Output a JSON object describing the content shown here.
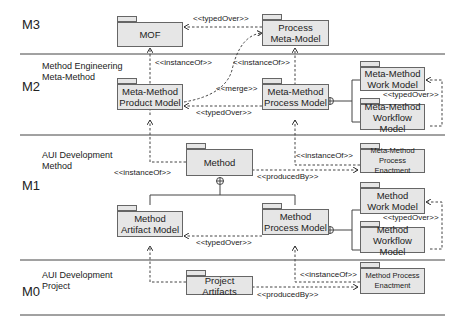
{
  "levels": [
    {
      "id": "M3",
      "label": "M3",
      "description": ""
    },
    {
      "id": "M2",
      "label": "M2",
      "description": "Method Engineering\nMeta-Method"
    },
    {
      "id": "M1",
      "label": "M1",
      "description": "AUI Development\nMethod"
    },
    {
      "id": "M0",
      "label": "M0",
      "description": "AUI Development\nProject"
    }
  ],
  "packages": {
    "mof": "MOF",
    "process_meta_model": "Process\nMeta-Model",
    "mm_product_model": "Meta-Method\nProduct Model",
    "mm_process_model": "Meta-Method\nProcess Model",
    "mm_work_model": "Meta-Method\nWork Model",
    "mm_workflow_model": "Meta-Method\nWorkflow Model",
    "method": "Method",
    "mm_process_enactment": "Meta-Method\nProcess Enactment",
    "method_artifact_model": "Method\nArtifact Model",
    "method_process_model": "Method\nProcess Model",
    "method_work_model": "Method\nWork Model",
    "method_workflow_model": "Method\nWorkflow Model",
    "project_artifacts": "Project Artifacts",
    "method_process_enactment": "Method Process\nEnactment"
  },
  "relations": {
    "m3_typed_over": "<<typedOver>>",
    "m2_instance_of_left": "<<instanceOf>>",
    "m2_instance_of_right": "<<instanceOf>>",
    "m2_merge": "<<merge>>",
    "m2_typed_over": "<<typedOver>>",
    "m2_work_typed_over": "<<typedOver>>",
    "m1_instance_of_left": "<<instanceOf>>",
    "m1_instance_of_right": "<<instanceOf>>",
    "m1_produced_by": "<<producedBy>>",
    "m1_typed_over": "<<typedOver>>",
    "m1_work_typed_over": "<<typedOver>>",
    "m0_instance_of": "<<instanceOf>>",
    "m0_produced_by": "<<producedBy>>"
  }
}
